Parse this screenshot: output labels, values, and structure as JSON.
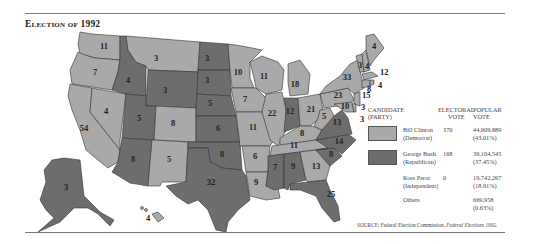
{
  "title": "Election of 1992",
  "colors": {
    "democrat": "#a9a9a9",
    "republican": "#6d6d6d",
    "border": "#333333",
    "rule": "#777777"
  },
  "legend": {
    "headers": {
      "candidate": "CANDIDATE",
      "party": "(PARTY)",
      "electoral_1": "ELECTORAL",
      "electoral_2": "VOTE",
      "popular_1": "POPULAR",
      "popular_2": "VOTE"
    },
    "rows": [
      {
        "name": "Bill Clinton",
        "party": "(Democrat)",
        "electoral": "370",
        "popular": "44,909,889",
        "percent": "(43.01%)",
        "swatch": "democrat"
      },
      {
        "name": "George Bush",
        "party": "(Republican)",
        "electoral": "168",
        "popular": "39,104,545",
        "percent": "(37.45%)",
        "swatch": "republican"
      },
      {
        "name": "Ross Perot",
        "party": "(Independent)",
        "electoral": "0",
        "popular": "19,742,267",
        "percent": "(18.91%)",
        "swatch": "none"
      },
      {
        "name": "Others",
        "party": "",
        "electoral": "",
        "popular": "669,958",
        "percent": "(0.63%)",
        "swatch": "none"
      }
    ]
  },
  "source": {
    "prefix": "SOURCE: Federal Election Commission, ",
    "italic": "Federal Elections 1992."
  },
  "states": {
    "WA": "11",
    "OR": "7",
    "CA": "54",
    "NV": "4",
    "ID": "4",
    "MT": "3",
    "WY": "3",
    "UT": "5",
    "CO": "8",
    "AZ": "8",
    "NM": "5",
    "ND": "3",
    "SD": "3",
    "NE": "5",
    "KS": "6",
    "OK": "8",
    "TX": "32",
    "MN": "10",
    "IA": "7",
    "MO": "11",
    "AR": "6",
    "LA": "9",
    "WI": "11",
    "IL": "22",
    "MI": "18",
    "IN": "12",
    "OH": "21",
    "KY": "8",
    "TN": "11",
    "MS": "7",
    "AL": "9",
    "GA": "13",
    "FL": "25",
    "SC": "8",
    "NC": "14",
    "VA": "13",
    "WV": "5",
    "PA": "23",
    "NY": "33",
    "VT": "3",
    "NH": "4",
    "ME": "4",
    "MA": "12",
    "RI": "4",
    "CT": "8",
    "NJ": "15",
    "DE": "3",
    "MD": "10",
    "DC": "3",
    "AK": "3",
    "HI": "4"
  }
}
